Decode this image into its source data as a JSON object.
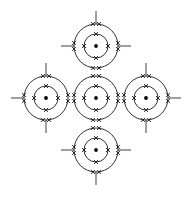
{
  "diagram": {
    "type": "atomic-shell-diagram",
    "canvas": {
      "width": 193,
      "height": 197,
      "background": "#ffffff"
    },
    "stroke_color": "#1a1a1a",
    "electron_color": "#0d0d0d",
    "nucleus_color": "#000000",
    "geometry": {
      "outer_shell_radius": 22,
      "inner_shell_radius": 12,
      "nucleus_radius": 1.9,
      "bond_line_length": 13,
      "electron_mark": "x",
      "outer_electrons_per_position": 2,
      "inner_electrons_per_position": 1,
      "electron_positions_deg": [
        270,
        0,
        90,
        180
      ]
    },
    "atoms": [
      {
        "id": "atom-top",
        "label": "top atom",
        "cx": 96,
        "cy": 46,
        "outer_pairs": 4,
        "inner_electrons": 4,
        "bonds": [
          "up",
          "left",
          "right"
        ]
      },
      {
        "id": "atom-left",
        "label": "left atom",
        "cx": 46,
        "cy": 98,
        "outer_pairs": 4,
        "inner_electrons": 4,
        "bonds": [
          "up",
          "left",
          "down"
        ]
      },
      {
        "id": "atom-center",
        "label": "center atom",
        "cx": 96,
        "cy": 98,
        "outer_pairs": 4,
        "inner_electrons": 4,
        "bonds": []
      },
      {
        "id": "atom-right",
        "label": "right atom",
        "cx": 146,
        "cy": 98,
        "outer_pairs": 4,
        "inner_electrons": 4,
        "bonds": [
          "up",
          "right",
          "down"
        ]
      },
      {
        "id": "atom-bottom",
        "label": "bottom atom",
        "cx": 96,
        "cy": 150,
        "outer_pairs": 4,
        "inner_electrons": 4,
        "bonds": [
          "left",
          "right",
          "down"
        ]
      }
    ]
  }
}
